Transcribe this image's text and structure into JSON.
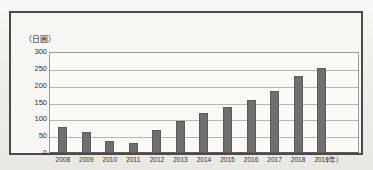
{
  "figure": {
    "unit_label": "（日圓）",
    "x_axis_unit": "（年）"
  },
  "chart_data": {
    "type": "bar",
    "title": "",
    "xlabel": "（年）",
    "ylabel": "（日圓）",
    "ylim": [
      0,
      300
    ],
    "yticks": [
      300,
      250,
      200,
      150,
      100,
      50,
      0
    ],
    "grid": true,
    "legend": "none",
    "categories": [
      "2008",
      "2009",
      "2010",
      "2011",
      "2012",
      "2013",
      "2014",
      "2015",
      "2016",
      "2017",
      "2018",
      "2019",
      ""
    ],
    "values": [
      77,
      62,
      37,
      30,
      68,
      94,
      120,
      138,
      157,
      185,
      230,
      252,
      0
    ],
    "bar_color": "#6f6f6f"
  }
}
